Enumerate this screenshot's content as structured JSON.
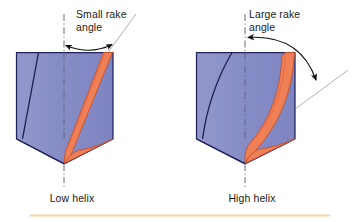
{
  "figure": {
    "type": "technical-illustration",
    "background_color": "#ffffff",
    "bottom_rule_color": "#f0d9a8"
  },
  "colors": {
    "body_fill": "#8289c4",
    "body_fill_light": "#9aa0d2",
    "body_outline": "#23235c",
    "flute_orange": "#ef7f55",
    "flute_orange_dark": "#e4663c",
    "flute_navy": "#1c1c50",
    "centerline": "#5a5a6e",
    "tangent_line": "#9a9a9a",
    "arc_arrow": "#111111",
    "text": "#1b1b1b"
  },
  "left_diagram": {
    "callout": {
      "line1": "Small rake",
      "line2": "angle"
    },
    "caption": "Low helix",
    "centerline_name": "drill-axis-centerline",
    "arc_name": "small-rake-angle-arc",
    "tangent_name": "rake-face-tangent-line"
  },
  "right_diagram": {
    "callout": {
      "line1": "Large rake",
      "line2": "angle"
    },
    "caption": "High helix",
    "centerline_name": "drill-axis-centerline",
    "arc_name": "large-rake-angle-arc",
    "tangent_name": "rake-face-tangent-line"
  }
}
